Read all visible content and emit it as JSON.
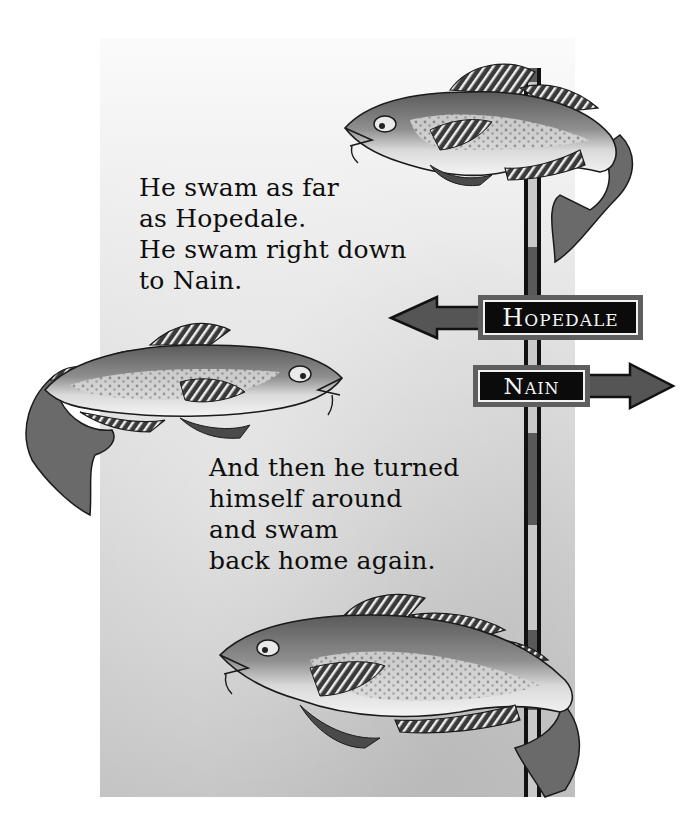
{
  "illustration": {
    "style": "grayscale picture-book page",
    "colors": {
      "background": "#ffffff",
      "panel_top": "#fbfbfb",
      "panel_bottom": "#c2c2c2",
      "text": "#0d0d0d",
      "pole_outline": "#111111",
      "pole_light": "#c9c9c9",
      "pole_dark": "#595959",
      "sign_border": "#5e5e5e",
      "sign_fill": "#0b0b0b",
      "sign_text": "#f5f5f5",
      "arrow_fill": "#555555"
    }
  },
  "verse_top": {
    "lines": [
      "He swam as far",
      "as Hopedale.",
      "He swam right down",
      "to Nain."
    ]
  },
  "verse_bottom": {
    "lines": [
      "And then he turned",
      "himself around",
      "and swam",
      "back home again."
    ]
  },
  "signpost": {
    "signs": [
      {
        "label": "Hopedale",
        "direction": "left",
        "icon": "arrow-left-icon"
      },
      {
        "label": "Nain",
        "direction": "right",
        "icon": "arrow-right-icon"
      }
    ]
  },
  "fish": [
    {
      "name": "cod-top",
      "facing": "left",
      "icon": "fish-icon"
    },
    {
      "name": "cod-middle",
      "facing": "right",
      "icon": "fish-icon"
    },
    {
      "name": "cod-bottom",
      "facing": "left",
      "icon": "fish-icon"
    }
  ]
}
